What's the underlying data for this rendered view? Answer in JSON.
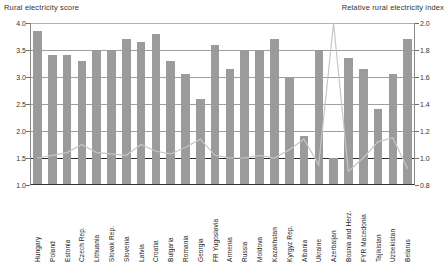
{
  "chart_data": {
    "type": "bar",
    "title": "",
    "left_axis_title": "Rural electricity score",
    "right_axis_title": "Relative rural electricity index",
    "xlabel": "",
    "ylabel": "Rural electricity score",
    "y2label": "Relative rural electricity index",
    "ylim": [
      1.0,
      4.0
    ],
    "y2lim": [
      0.8,
      2.0
    ],
    "yticks": [
      "1.0",
      "1.5",
      "2.0",
      "2.5",
      "3.0",
      "3.5",
      "4.0"
    ],
    "y2ticks": [
      "0.8",
      "1.0",
      "1.2",
      "1.4",
      "1.6",
      "1.8",
      "2.0"
    ],
    "grid": true,
    "legend": "none",
    "bar_color": "#9b9b9b",
    "line_color": "#c6c6c6",
    "categories": [
      "Hungary",
      "Poland",
      "Estonia",
      "Czech Rep.",
      "Lithuania",
      "Slovak Rep.",
      "Slovenia",
      "Latvia",
      "Croatia",
      "Bulgaria",
      "Romania",
      "Georgia",
      "FR Yugoslavia",
      "Armenia",
      "Russia",
      "Moldova",
      "Kazakhstan",
      "Kyrgyz Rep.",
      "Albania",
      "Ukraine",
      "Azerbaijan",
      "Bosnia and Herz.",
      "FYR Macedonia",
      "Tajikistan",
      "Uzbekistan",
      "Belarus"
    ],
    "series": [
      {
        "name": "Rural electricity score",
        "type": "bar",
        "axis": "left",
        "values": [
          3.85,
          3.4,
          3.4,
          3.3,
          3.5,
          3.5,
          3.7,
          3.65,
          3.8,
          3.3,
          3.05,
          2.6,
          3.6,
          3.15,
          3.5,
          3.5,
          3.7,
          3.0,
          1.9,
          3.5,
          1.5,
          3.35,
          3.15,
          2.4,
          3.05,
          3.7
        ]
      },
      {
        "name": "Relative rural electricity index",
        "type": "line",
        "axis": "right",
        "values": [
          1.0,
          1.02,
          1.04,
          1.1,
          1.04,
          1.03,
          1.02,
          1.1,
          1.05,
          1.03,
          1.08,
          1.14,
          1.02,
          1.0,
          1.0,
          1.02,
          1.0,
          1.06,
          1.14,
          0.95,
          2.0,
          0.9,
          1.0,
          1.12,
          1.15,
          0.92
        ]
      }
    ]
  }
}
